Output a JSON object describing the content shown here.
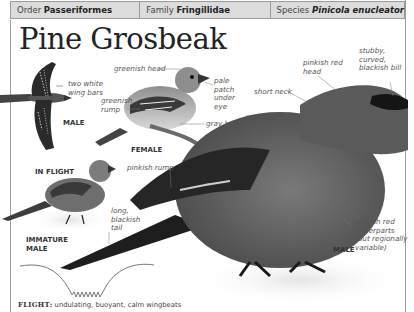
{
  "taxonomy": {
    "order_label": "Order",
    "order_value": "Passeriformes",
    "family_label": "Family",
    "family_value": "Fringillidae",
    "species_label": "Species",
    "species_value": "Pinicola enucleator"
  },
  "title": "Pine Grosbeak",
  "annotations": {
    "two_white_wing_bars": [
      "two white",
      "wing bars"
    ],
    "greenish_head": "greenish head",
    "pale_patch": [
      "pale",
      "patch",
      "under",
      "eye"
    ],
    "greenish_rump": [
      "greenish",
      "rump"
    ],
    "gray_belly": "gray belly",
    "pinkish_red_head": [
      "pinkish red",
      "head"
    ],
    "stubby_bill": [
      "stubby,",
      "curved,",
      "blackish bill"
    ],
    "short_neck": "short neck",
    "pinkish_rump": "pinkish rump",
    "long_tail": [
      "long,",
      "blackish",
      "tail"
    ],
    "pinkish_underparts": [
      "pinkish red",
      "underparts",
      "(but regionally",
      "variable)"
    ]
  },
  "captions": {
    "flight_male": "MALE",
    "in_flight": "IN FLIGHT",
    "female": "FEMALE",
    "immature_male": [
      "IMMATURE",
      "MALE"
    ],
    "male": "MALE"
  },
  "flight": {
    "label": "FLIGHT:",
    "description": "undulating, buoyant, calm wingbeats"
  },
  "colors": {
    "header_bg": "#dcdcdc",
    "rule": "#9a9a9a",
    "text": "#333333",
    "annotation": "#555555"
  }
}
